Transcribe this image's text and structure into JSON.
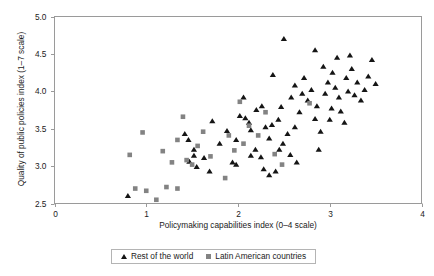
{
  "figure": {
    "cut_title": "",
    "legend": {
      "entries": [
        {
          "marker": "triangle-marker",
          "label": "Rest of the world",
          "color": "#151515"
        },
        {
          "marker": "square-marker",
          "label": "Latin American countries",
          "color": "#838383"
        }
      ]
    }
  },
  "chart_data": {
    "type": "scatter",
    "title": "",
    "xlabel": "Policymaking capabilities index (0–4 scale)",
    "ylabel": "Quality of public policies index (1–7 scale)",
    "xlim": [
      0,
      4
    ],
    "ylim": [
      2.5,
      5.0
    ],
    "xticks": [
      "0",
      "1",
      "2",
      "3",
      "4"
    ],
    "xtick_values": [
      0,
      1,
      2,
      3,
      4
    ],
    "yticks": [
      "2.5",
      "3.0",
      "3.5",
      "4.0",
      "4.5",
      "5.0"
    ],
    "ytick_values": [
      2.5,
      3.0,
      3.5,
      4.0,
      4.5,
      5.0
    ],
    "grid": false,
    "legend_position": "bottom-center",
    "series": [
      {
        "name": "Rest of the world",
        "marker": "triangle",
        "color": "#151515",
        "points": [
          [
            0.8,
            2.6
          ],
          [
            1.52,
            3.22
          ],
          [
            1.52,
            3.14
          ],
          [
            1.47,
            3.06
          ],
          [
            1.63,
            3.11
          ],
          [
            1.55,
            2.99
          ],
          [
            1.69,
            2.93
          ],
          [
            1.42,
            3.43
          ],
          [
            1.46,
            3.35
          ],
          [
            1.8,
            3.3
          ],
          [
            1.94,
            3.05
          ],
          [
            1.98,
            3.02
          ],
          [
            1.88,
            3.47
          ],
          [
            2.02,
            3.67
          ],
          [
            2.08,
            3.64
          ],
          [
            2.19,
            3.22
          ],
          [
            2.14,
            3.14
          ],
          [
            2.25,
            3.12
          ],
          [
            2.34,
            3.37
          ],
          [
            2.3,
            3.52
          ],
          [
            2.37,
            3.55
          ],
          [
            2.28,
            2.96
          ],
          [
            2.41,
            2.93
          ],
          [
            2.2,
            3.75
          ],
          [
            2.26,
            3.8
          ],
          [
            2.47,
            3.79
          ],
          [
            2.44,
            3.62
          ],
          [
            2.54,
            3.43
          ],
          [
            2.49,
            3.3
          ],
          [
            2.57,
            3.15
          ],
          [
            2.62,
            3.52
          ],
          [
            2.67,
            3.72
          ],
          [
            2.58,
            3.92
          ],
          [
            2.7,
            3.97
          ],
          [
            2.76,
            3.88
          ],
          [
            2.62,
            4.08
          ],
          [
            2.72,
            4.18
          ],
          [
            2.8,
            4.02
          ],
          [
            2.86,
            3.8
          ],
          [
            2.84,
            3.63
          ],
          [
            2.9,
            3.46
          ],
          [
            2.95,
            3.97
          ],
          [
            2.98,
            4.12
          ],
          [
            3.03,
            4.25
          ],
          [
            2.93,
            4.33
          ],
          [
            3.06,
            4.05
          ],
          [
            3.1,
            3.92
          ],
          [
            3.02,
            3.77
          ],
          [
            3.12,
            3.73
          ],
          [
            3.16,
            3.58
          ],
          [
            3.2,
            4.0
          ],
          [
            3.18,
            4.18
          ],
          [
            3.24,
            4.3
          ],
          [
            3.3,
            4.12
          ],
          [
            3.27,
            3.95
          ],
          [
            3.34,
            3.88
          ],
          [
            3.38,
            4.02
          ],
          [
            3.42,
            4.2
          ],
          [
            3.46,
            4.42
          ],
          [
            3.5,
            4.1
          ],
          [
            3.08,
            4.45
          ],
          [
            2.5,
            4.7
          ],
          [
            2.84,
            4.55
          ],
          [
            3.22,
            4.48
          ],
          [
            2.38,
            4.22
          ],
          [
            2.06,
            3.92
          ],
          [
            1.72,
            3.6
          ],
          [
            2.12,
            3.58
          ],
          [
            2.64,
            3.05
          ],
          [
            2.88,
            3.22
          ],
          [
            2.45,
            3.22
          ],
          [
            2.34,
            2.88
          ],
          [
            3.0,
            3.62
          ],
          [
            2.14,
            3.48
          ],
          [
            1.98,
            3.35
          ]
        ]
      },
      {
        "name": "Latin American countries",
        "marker": "square",
        "color": "#838383",
        "points": [
          [
            0.96,
            3.45
          ],
          [
            0.88,
            2.7
          ],
          [
            1.0,
            2.67
          ],
          [
            1.11,
            2.55
          ],
          [
            1.22,
            2.72
          ],
          [
            1.34,
            2.7
          ],
          [
            1.28,
            3.05
          ],
          [
            1.18,
            3.2
          ],
          [
            1.44,
            3.08
          ],
          [
            1.5,
            3.02
          ],
          [
            1.56,
            3.27
          ],
          [
            1.62,
            3.46
          ],
          [
            1.7,
            3.13
          ],
          [
            1.4,
            3.66
          ],
          [
            1.9,
            3.41
          ],
          [
            1.96,
            3.21
          ],
          [
            2.06,
            3.3
          ],
          [
            2.12,
            3.54
          ],
          [
            2.02,
            3.86
          ],
          [
            2.22,
            3.41
          ],
          [
            2.3,
            3.72
          ],
          [
            2.4,
            3.16
          ],
          [
            2.48,
            3.02
          ],
          [
            1.86,
            2.84
          ],
          [
            2.78,
            3.84
          ],
          [
            1.34,
            3.35
          ],
          [
            0.82,
            3.15
          ]
        ]
      }
    ]
  }
}
